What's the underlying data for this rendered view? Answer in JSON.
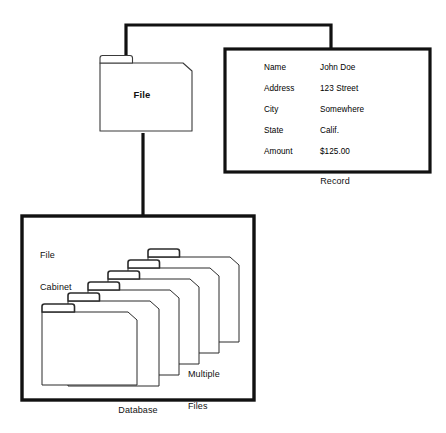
{
  "diagram": {
    "colors": {
      "stroke_heavy": "#111111",
      "stroke_light": "#333333",
      "background": "#ffffff",
      "text": "#111111"
    },
    "nodes": {
      "file": {
        "label": "File",
        "shape": "folder"
      },
      "record": {
        "caption": "Record",
        "shape": "rectangle",
        "fields": [
          {
            "key": "Name",
            "value": "John Doe"
          },
          {
            "key": "Address",
            "value": "123 Street"
          },
          {
            "key": "City",
            "value": "Somewhere"
          },
          {
            "key": "State",
            "value": "Calif."
          },
          {
            "key": "Amount",
            "value": "$125.00"
          }
        ]
      },
      "database": {
        "caption": "Database",
        "shape": "rectangle",
        "file_cabinet_label_line1": "File",
        "file_cabinet_label_line2": "Cabinet",
        "multiple_files_label_line1": "Multiple",
        "multiple_files_label_line2": "Files",
        "folder_count": 6
      }
    },
    "connectors": [
      {
        "name": "file-to-record",
        "style": "bracket"
      },
      {
        "name": "file-to-database",
        "style": "vertical"
      }
    ]
  }
}
